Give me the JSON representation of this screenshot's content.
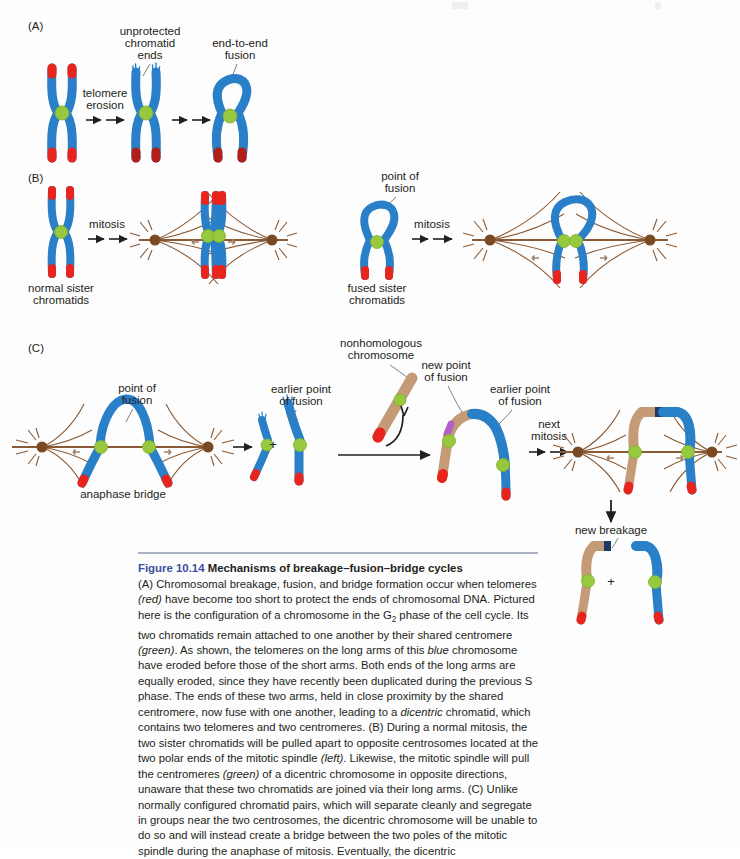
{
  "figure": {
    "panels": [
      {
        "id": "A",
        "label": "(A)"
      },
      {
        "id": "B",
        "label": "(B)"
      },
      {
        "id": "C",
        "label": "(C)"
      }
    ],
    "panel_a": {
      "letter": "(A)",
      "label_unprotected_1": "unprotected",
      "label_unprotected_2": "chromatid",
      "label_unprotected_3": "ends",
      "label_fusion_1": "end-to-end",
      "label_fusion_2": "fusion",
      "arrow_label_1": "telomere",
      "arrow_label_2": "erosion"
    },
    "panel_b": {
      "letter": "(B)",
      "arrow_label_left": "mitosis",
      "arrow_label_right": "mitosis",
      "label_normal_1": "normal sister",
      "label_normal_2": "chromatids",
      "label_fused_1": "fused sister",
      "label_fused_2": "chromatids",
      "label_point_of_fusion_1": "point of",
      "label_point_of_fusion_2": "fusion"
    },
    "panel_c": {
      "letter": "(C)",
      "label_point_of_fusion_1": "point of",
      "label_point_of_fusion_2": "fusion",
      "label_anaphase_bridge": "anaphase bridge",
      "label_earlier_point_1": "earlier point",
      "label_earlier_point_2": "of fusion",
      "label_nonhomologous_1": "nonhomologous",
      "label_nonhomologous_2": "chromosome",
      "label_new_point_1": "new point",
      "label_new_point_2": "of fusion",
      "label_earlier_point_b_1": "earlier point",
      "label_earlier_point_b_2": "of fusion",
      "arrow_label_next_1": "next",
      "arrow_label_next_2": "mitosis",
      "label_new_breakage": "new breakage",
      "plus_sign_1": "+",
      "plus_sign_2": "+"
    },
    "colors": {
      "chromosome_blue": "#2a7fc9",
      "chromosome_blue_dark": "#1d66a8",
      "telomere_red": "#e8251d",
      "centromere_green": "#96c93d",
      "centromere_green_edge": "#7fae2f",
      "spindle_brown": "#8a5a35",
      "centrosome_brown": "#7a4a22",
      "nonhomologous_tan": "#c49a77",
      "nonhomologous_tan_dark": "#b2855f",
      "fusion_purple": "#b45ec8",
      "breakage_navy": "#1b3a66",
      "leader_gray": "#6f7072",
      "rule_blue": "#a9b0c4",
      "fignum_blue": "#3b4fa0"
    }
  },
  "caption": {
    "figure_number": "Figure 10.14",
    "title": "Mechanisms of breakage–fusion–bridge cycles",
    "paragraphs": [
      "(A) Chromosomal breakage, fusion, and bridge formation occur when telomeres (red) have become too short to protect the ends of chromosomal DNA. Pictured here is the configuration of a chromosome in the G2 phase of the cell cycle. Its two chromatids remain attached to one another by their shared centromere (green). As shown, the telomeres on the long arms of this blue chromosome have eroded before those of the short arms. Both ends of the long arms are equally eroded, since they have recently been duplicated during the previous S phase. The ends of these two arms, held in close proximity by the shared centromere, now fuse with one another, leading to a dicentric chromatid, which contains two telomeres and two centromeres. (B) During a normal mitosis, the two sister chromatids will be pulled apart to opposite centrosomes located at the two polar ends of the mitotic spindle (left). Likewise, the mitotic spindle will pull the centromeres (green) of a dicentric chromosome in opposite directions, unaware that these two chromatids are joined via their long arms. (C) Unlike normally configured chromatid pairs, which will separate cleanly and segregate in groups near the two centrosomes, the dicentric chromosome will be unable to do so and will instead create a bridge between the two poles of the mitotic spindle during the anaphase of mitosis. Eventually, the dicentric"
    ]
  }
}
